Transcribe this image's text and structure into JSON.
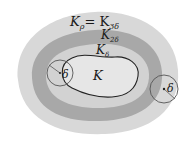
{
  "diagram": {
    "labels": {
      "outer": "K",
      "outer_sub": "ρ",
      "outer_eq": "= K",
      "outer_eq_sub": "3δ",
      "middle": "K",
      "middle_sub": "2δ",
      "inner": "K",
      "inner_sub": "δ",
      "core": "K",
      "delta_left": "δ",
      "delta_right": "δ"
    },
    "colors": {
      "outer_region": "#d8d8d8",
      "middle_region": "#a8a8a8",
      "inner_region": "#d2d2d2",
      "core_region": "#e6e6e6",
      "core_outline": "#222222",
      "circle_stroke": "#555555"
    }
  }
}
